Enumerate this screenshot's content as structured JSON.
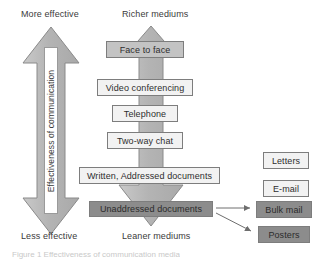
{
  "figure": {
    "type": "communication-media-richness-diagram",
    "caption": "Figure 1 Effectiveness of communication media"
  },
  "axis_labels": {
    "top_left": "More effective",
    "top_center": "Richer mediums",
    "bottom_left": "Less effective",
    "bottom_center": "Leaner mediums"
  },
  "left_arrow": {
    "name": "effectiveness-double-arrow",
    "label": "Effectiveness of communication",
    "direction": "double-headed-vertical",
    "fill": "#b9b9b9"
  },
  "center_arrow": {
    "name": "richness-double-arrow",
    "direction": "double-headed-vertical",
    "fill": "#b9b9b9"
  },
  "media_scale": [
    {
      "label": "Face to face",
      "fill": "#c3c3c3",
      "rank": 1
    },
    {
      "label": "Video conferencing",
      "fill": "#f2f2f2",
      "rank": 2
    },
    {
      "label": "Telephone",
      "fill": "#f2f2f2",
      "rank": 3
    },
    {
      "label": "Two-way chat",
      "fill": "#f2f2f2",
      "rank": 4
    },
    {
      "label": "Written, Addressed documents",
      "fill": "#f2f2f2",
      "rank": 5
    },
    {
      "label": "Unaddressed documents",
      "fill": "#8c8c8c",
      "rank": 6
    }
  ],
  "side_examples": [
    {
      "label": "Letters",
      "fill": "#f2f2f2",
      "linked": false
    },
    {
      "label": "E-mail",
      "fill": "#f2f2f2",
      "linked": false
    },
    {
      "label": "Bulk mail",
      "fill": "#8c8c8c",
      "linked": true
    },
    {
      "label": "Posters",
      "fill": "#8c8c8c",
      "linked": true
    }
  ],
  "colors": {
    "arrow_fill": "#b9b9b9",
    "arrow_stroke": "#7d7d7d",
    "box_light": "#f2f2f2",
    "box_mid": "#c3c3c3",
    "box_dark": "#8c8c8c",
    "text": "#2e2e2e"
  }
}
